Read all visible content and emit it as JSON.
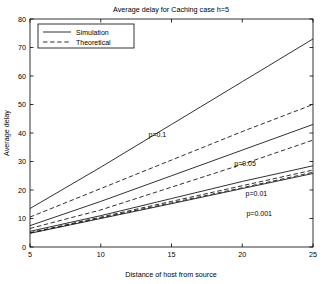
{
  "chart_data": {
    "type": "line",
    "title": "Average delay for Caching case   h=5",
    "xlabel": "Distance of host from source",
    "ylabel": "Average delay",
    "xlim": [
      5,
      25
    ],
    "ylim": [
      0,
      80
    ],
    "xticks": [
      5,
      10,
      15,
      20,
      25
    ],
    "yticks": [
      0,
      10,
      20,
      30,
      40,
      50,
      60,
      70,
      80
    ],
    "grid": false,
    "legend_position": "top-left",
    "legend": [
      {
        "label": "Simulation",
        "style": "solid"
      },
      {
        "label": "Theoretical",
        "style": "dashed"
      }
    ],
    "x": [
      5,
      10,
      15,
      20,
      25
    ],
    "series": [
      {
        "name": "Simulation p=0.1",
        "p": 0.1,
        "style": "solid",
        "values": [
          13.5,
          28.0,
          43.0,
          58.0,
          73.0
        ]
      },
      {
        "name": "Theoretical p=0.1",
        "p": 0.1,
        "style": "dashed",
        "values": [
          10.5,
          20.5,
          30.5,
          40.5,
          50.0
        ]
      },
      {
        "name": "Simulation p=0.05",
        "p": 0.05,
        "style": "solid",
        "values": [
          7.5,
          16.0,
          25.0,
          34.0,
          43.0
        ]
      },
      {
        "name": "Theoretical p=0.05",
        "p": 0.05,
        "style": "dashed",
        "values": [
          6.5,
          13.0,
          21.0,
          29.0,
          37.5
        ]
      },
      {
        "name": "Simulation p=0.01",
        "p": 0.01,
        "style": "solid",
        "values": [
          5.5,
          11.0,
          17.0,
          23.0,
          28.5
        ]
      },
      {
        "name": "Theoretical p=0.01",
        "p": 0.01,
        "style": "dashed",
        "values": [
          5.0,
          10.5,
          16.0,
          21.5,
          27.0
        ]
      },
      {
        "name": "Simulation p=0.001",
        "p": 0.001,
        "style": "solid",
        "values": [
          4.8,
          10.0,
          15.2,
          20.5,
          25.8
        ]
      },
      {
        "name": "Theoretical p=0.001",
        "p": 0.001,
        "style": "dashed",
        "values": [
          4.9,
          10.2,
          15.5,
          20.8,
          26.2
        ]
      }
    ],
    "annotations": [
      {
        "text": "p=0.1",
        "x": 14.0,
        "y": 38.5
      },
      {
        "text": "p=0.05",
        "x": 20.2,
        "y": 28.5
      },
      {
        "text": "p=0.01",
        "x": 21.0,
        "y": 18.0
      },
      {
        "text": "p=0.001",
        "x": 21.2,
        "y": 11.0
      }
    ]
  },
  "colors": {
    "line": "#1a1a1a",
    "frame": "#000000",
    "background": "#ffffff"
  }
}
